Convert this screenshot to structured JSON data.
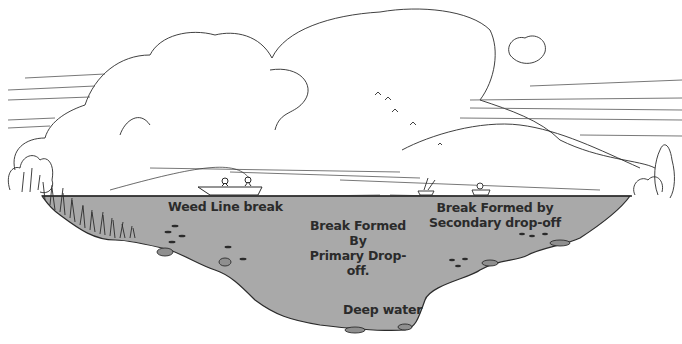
{
  "diagram": {
    "type": "lake-cross-section-illustration",
    "colors": {
      "water": "#a9a9a9",
      "ink": "#2b2b2b",
      "background": "#ffffff"
    },
    "labels": {
      "weed_line": "Weed Line break",
      "primary": {
        "line1": "Break Formed",
        "line2": "By",
        "line3": "Primary Drop-",
        "line4": "off."
      },
      "secondary": {
        "line1": "Break Formed by",
        "line2": "Secondary drop-off"
      },
      "deep": "Deep water"
    },
    "elements": [
      "clouds",
      "birds",
      "shoreline-trees",
      "weeds",
      "fishing-boat-with-two-anglers",
      "small-boat-anglers",
      "fish-schools",
      "rocks"
    ]
  }
}
